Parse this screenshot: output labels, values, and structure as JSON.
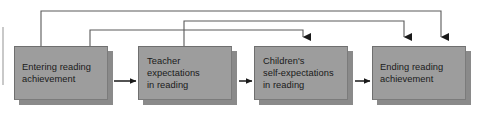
{
  "diagram": {
    "type": "flow-diagram",
    "colors": {
      "box_fill": "#9d9d9d",
      "box_shadow": "#8a8a8a",
      "box_border": "#6f6f6f",
      "connector": "#1a1a1a",
      "feedback_connector": "#5a5a5a",
      "text": "#1a1a1a",
      "background": "#ffffff"
    },
    "nodes": [
      {
        "id": "entering-reading-achievement",
        "label": "Entering reading\nachievement",
        "x": 14,
        "y": 46,
        "width": 94,
        "height": 54,
        "align": "centered"
      },
      {
        "id": "teacher-expectations-in-reading",
        "label": "Teacher\nexpectations\nin reading",
        "x": 138,
        "y": 46,
        "width": 94,
        "height": 54,
        "align": "left"
      },
      {
        "id": "childrens-self-expectations-in-reading",
        "label": "Children's\nself-expectations\nin reading",
        "x": 254,
        "y": 46,
        "width": 94,
        "height": 54,
        "align": "left"
      },
      {
        "id": "ending-reading-achievement",
        "label": "Ending reading\nachievement",
        "x": 372,
        "y": 46,
        "width": 94,
        "height": 54,
        "align": "centered"
      }
    ],
    "sequential_arrows": [
      {
        "id": "arrow-entering-to-teacher",
        "from": "entering-reading-achievement",
        "to": "teacher-expectations-in-reading",
        "x1": 114,
        "x2": 136,
        "y": 81
      },
      {
        "id": "arrow-teacher-to-children",
        "from": "teacher-expectations-in-reading",
        "to": "childrens-self-expectations-in-reading",
        "x1": 238,
        "x2": 252,
        "y": 81
      },
      {
        "id": "arrow-children-to-ending",
        "from": "childrens-self-expectations-in-reading",
        "to": "ending-reading-achievement",
        "x1": 354,
        "x2": 370,
        "y": 81
      }
    ],
    "feedback_arrows": [
      {
        "id": "path-entering-to-ending",
        "from": "entering-reading-achievement",
        "to": "ending-reading-achievement",
        "start_x": 41,
        "rail_y": 11,
        "end_x": 441,
        "end_y": 45
      },
      {
        "id": "path-entering-to-children",
        "from": "entering-reading-achievement",
        "to": "childrens-self-expectations-in-reading",
        "start_x": 90,
        "rail_y": 30,
        "end_x": 303,
        "end_y": 45
      },
      {
        "id": "path-teacher-to-ending",
        "from": "teacher-expectations-in-reading",
        "to": "ending-reading-achievement",
        "start_x": 184,
        "rail_y": 21,
        "end_x": 404,
        "end_y": 45
      }
    ]
  }
}
